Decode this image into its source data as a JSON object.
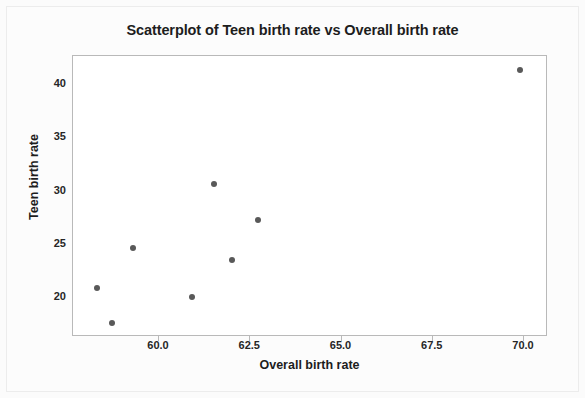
{
  "chart_data": {
    "type": "scatter",
    "title": "Scatterplot of Teen birth rate vs Overall birth rate",
    "xlabel": "Overall birth rate",
    "ylabel": "Teen birth rate",
    "xticks": [
      "60.0",
      "62.5",
      "65.0",
      "67.5",
      "70.0"
    ],
    "xtick_values": [
      60.0,
      62.5,
      65.0,
      67.5,
      70.0
    ],
    "yticks": [
      "20",
      "25",
      "30",
      "35",
      "40"
    ],
    "ytick_values": [
      20,
      25,
      30,
      35,
      40
    ],
    "xlim": [
      57.7,
      70.7
    ],
    "ylim": [
      16.4,
      42.5
    ],
    "grid": false,
    "legend": null,
    "marker_color": "#595959",
    "plot_background": "#ffffff",
    "frame_color": "#b9b9b9",
    "points": [
      {
        "x": 58.3,
        "y": 20.8
      },
      {
        "x": 58.7,
        "y": 17.6
      },
      {
        "x": 59.3,
        "y": 24.6
      },
      {
        "x": 60.9,
        "y": 20.0
      },
      {
        "x": 61.5,
        "y": 30.6
      },
      {
        "x": 62.0,
        "y": 23.5
      },
      {
        "x": 62.7,
        "y": 27.2
      },
      {
        "x": 69.9,
        "y": 41.3
      }
    ]
  },
  "figure": {
    "title": "Scatterplot of Teen birth rate vs Overall birth rate",
    "x_axis_title": "Overall birth rate",
    "y_axis_title": "Teen birth rate"
  }
}
